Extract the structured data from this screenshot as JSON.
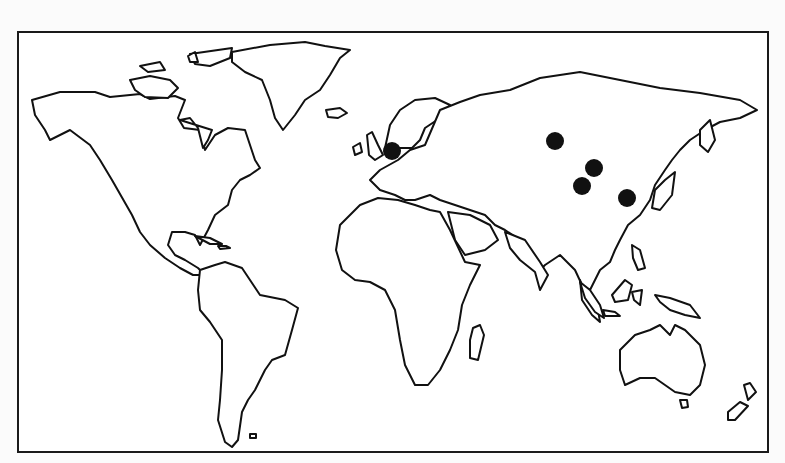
{
  "map": {
    "type": "world-outline",
    "projection": "simplified-equirectangular",
    "frame": {
      "x": 17,
      "y": 31,
      "width": 752,
      "height": 422,
      "border_color": "#1a1a1a"
    },
    "land_stroke": "#111111",
    "background": "#ffffff",
    "markers": [
      {
        "id": "marker-europe",
        "region": "Western Europe",
        "x": 392,
        "y": 151,
        "r": 9,
        "color": "#111111"
      },
      {
        "id": "marker-central-asia-north",
        "region": "Southern Siberia / Central Asia",
        "x": 555,
        "y": 141,
        "r": 9,
        "color": "#111111"
      },
      {
        "id": "marker-mongolia",
        "region": "Mongolia",
        "x": 594,
        "y": 168,
        "r": 9,
        "color": "#111111"
      },
      {
        "id": "marker-north-china",
        "region": "North China",
        "x": 582,
        "y": 186,
        "r": 9,
        "color": "#111111"
      },
      {
        "id": "marker-east-china",
        "region": "East China coast",
        "x": 627,
        "y": 198,
        "r": 9,
        "color": "#111111"
      }
    ]
  }
}
